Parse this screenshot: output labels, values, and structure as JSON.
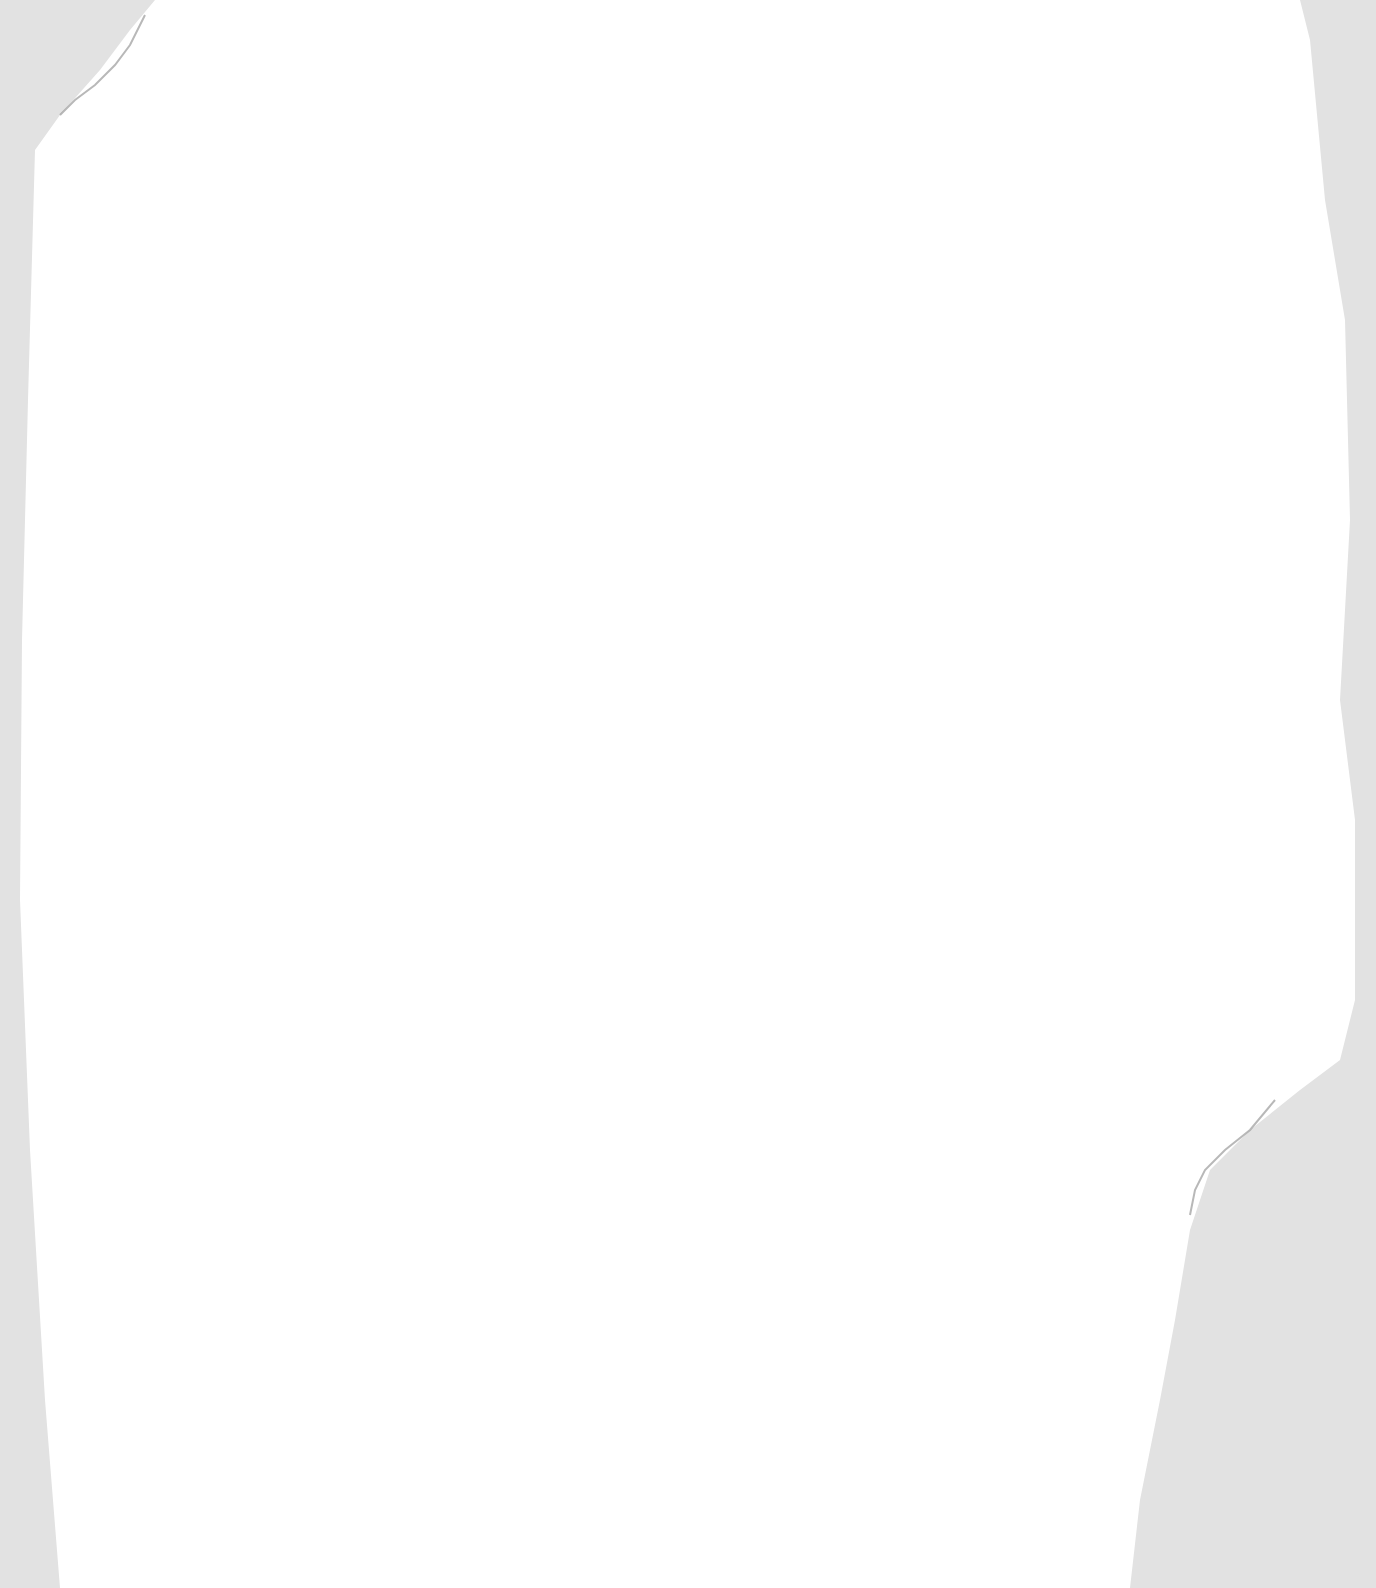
{
  "scene": {
    "description": "Scanned torn sheet of blank white paper on light gray background",
    "background_color": "#e2e2e2",
    "paper_color": "#ffffff",
    "edge_shadow_color": "#9a9a9a",
    "text": []
  }
}
